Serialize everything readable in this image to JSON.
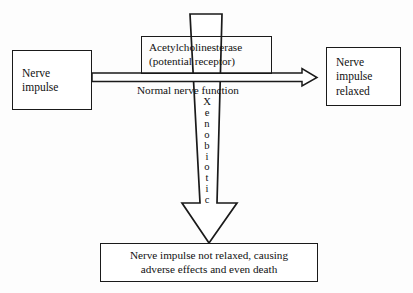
{
  "diagram": {
    "canvas": {
      "width": 413,
      "height": 293
    },
    "colors": {
      "background": "#fdfdfd",
      "stroke": "#1a1a1a",
      "text": "#111111",
      "fill": "#ffffff"
    },
    "nodes": {
      "nerve_impulse": {
        "line1": "Nerve",
        "line2": "impulse"
      },
      "acetylcholinesterase": {
        "line1": "Acetylcholinesterase",
        "line2": "(potential receptor)"
      },
      "nerve_impulse_relaxed": {
        "line1": "Nerve",
        "line2": "impulse",
        "line3": "relaxed"
      },
      "outcome": {
        "line1": "Nerve impulse not relaxed, causing",
        "line2": "adverse effects and even death"
      }
    },
    "edges": {
      "horizontal": {
        "label": "Normal nerve function",
        "style": "hollow double-line arrow pointing right"
      },
      "vertical": {
        "label_letters": [
          "X",
          "e",
          "n",
          "o",
          "b",
          "i",
          "o",
          "t",
          "i",
          "c"
        ],
        "label_text": "Xenobiotic",
        "style": "large hollow tapering block arrow pointing down"
      }
    }
  }
}
